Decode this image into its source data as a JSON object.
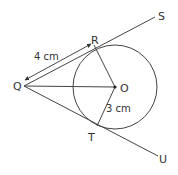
{
  "figure": {
    "points": {
      "Q": {
        "label": "Q",
        "x": 24,
        "y": 86
      },
      "O": {
        "label": "O",
        "x": 115,
        "y": 87
      },
      "R": {
        "label": "R",
        "x": 94,
        "y": 45
      },
      "T": {
        "label": "T",
        "x": 97,
        "y": 126
      },
      "S": {
        "label": "S",
        "x": 155,
        "y": 17
      },
      "U": {
        "label": "U",
        "x": 158,
        "y": 156
      }
    },
    "circle": {
      "center": "O",
      "radius_px": 42
    },
    "measurements": {
      "QR": "4 cm",
      "OT": "3 cm"
    },
    "colors": {
      "stroke": "#333333",
      "background": "#ffffff"
    }
  }
}
